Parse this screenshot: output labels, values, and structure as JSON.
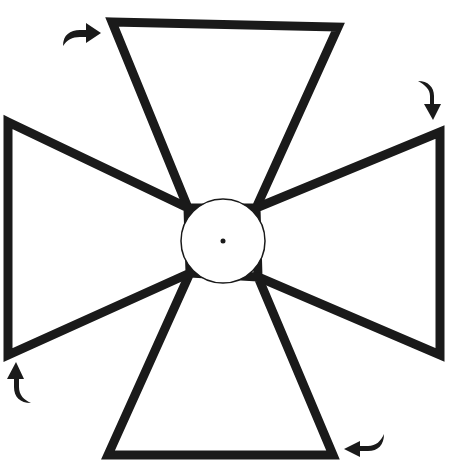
{
  "diagram": {
    "colors": {
      "stroke": "#1a1a1a",
      "fill": "#ffffff",
      "background": "#ffffff"
    },
    "center": {
      "x": 223,
      "y": 241,
      "radius": 42
    },
    "arms": [
      {
        "name": "top",
        "points": "112,22 338,27 256,208 188,208"
      },
      {
        "name": "right",
        "points": "440,132 440,355 258,277 256,208"
      },
      {
        "name": "bottom",
        "points": "108,455 333,455 258,277 190,273"
      },
      {
        "name": "left",
        "points": "8,122 188,208 190,273 8,355"
      }
    ],
    "arrows": [
      {
        "name": "top-left",
        "direction": "right"
      },
      {
        "name": "top-right",
        "direction": "down"
      },
      {
        "name": "bottom-right",
        "direction": "left"
      },
      {
        "name": "bottom-left",
        "direction": "up"
      }
    ]
  }
}
